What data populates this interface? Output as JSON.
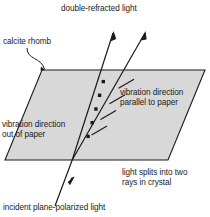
{
  "figure": {
    "background_color": "#ffffff",
    "stroke_color": "#1a1a1a",
    "rhomb_fill_color": "#d8d8d8"
  },
  "labels": {
    "double_refracted": "double-refracted light",
    "calcite_rhomb": "calcite rhomb",
    "vibration_parallel": "vibration direction\nparallel to paper",
    "vibration_out": "vibration direction\nout of paper",
    "splits": "light splits into two\nrays in crystal",
    "incident": "incident plane-polarized light"
  },
  "geometry": {
    "rhomb_points": "42,70 205,70 168,160 5,160",
    "ordinary_ray": {
      "description": "nearly vertical ray marked with dots, vibration out of paper",
      "path": "M 55,206 L 113,33",
      "dot_count": 5
    },
    "extraordinary_ray": {
      "description": "slanted ray marked with ticks, vibration parallel to paper",
      "path": "M 72,160 L 145,33",
      "tick_count": 4
    },
    "arrow_heads": [
      {
        "name": "ordinary-ray-arrow",
        "x": 113,
        "y": 33
      },
      {
        "name": "extraordinary-ray-arrow",
        "x": 145,
        "y": 33
      },
      {
        "name": "incident-ray-arrow",
        "x": 73,
        "y": 182
      }
    ],
    "leader_line": {
      "name": "calcite-rhomb-leader",
      "path": "M 27,48 C 27,60 42,58 45,70"
    }
  }
}
